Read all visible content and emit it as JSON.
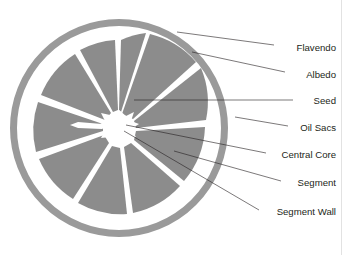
{
  "figure": {
    "background_color": "#ffffff",
    "border_color": "#e2e2e2",
    "width": 345,
    "height": 255
  },
  "colors": {
    "rind": "#9a9a9a",
    "segment_flesh": "#8c8c8c",
    "albedo": "#ffffff",
    "segment_wall": "#ffffff",
    "central_core": "#ffffff",
    "leader_line": "#231f20",
    "label_text": "#231f20"
  },
  "fruit": {
    "name": "citrus-cross-section",
    "center_x": 119,
    "center_y": 128,
    "outer_radius": 109,
    "rind_thickness": 7,
    "albedo_outer_radius": 102,
    "flesh_outer_radius": 88,
    "core_radius": 15,
    "segment_count": 10
  },
  "labels": [
    {
      "id": "flavendo",
      "text": "Flavendo",
      "text_x": 336,
      "text_y": 48,
      "leader_start_x": 274,
      "leader_start_y": 45,
      "leader_end_x": 177,
      "leader_end_y": 32,
      "points_to": "outer-rind"
    },
    {
      "id": "albedo",
      "text": "Albedo",
      "text_x": 336,
      "text_y": 75,
      "leader_start_x": 285,
      "leader_start_y": 72,
      "leader_end_x": 192,
      "leader_end_y": 52,
      "points_to": "white-pith-layer"
    },
    {
      "id": "seed",
      "text": "Seed",
      "text_x": 336,
      "text_y": 101,
      "leader_start_x": 293,
      "leader_start_y": 100,
      "leader_end_x": 134,
      "leader_end_y": 100,
      "points_to": "seed-cavity"
    },
    {
      "id": "oil-sacs",
      "text": "Oil Sacs",
      "text_x": 336,
      "text_y": 128,
      "leader_start_x": 288,
      "leader_start_y": 126,
      "leader_end_x": 235,
      "leader_end_y": 117,
      "points_to": "rind-oil-glands"
    },
    {
      "id": "central-core",
      "text": "Central Core",
      "text_x": 336,
      "text_y": 155,
      "leader_start_x": 266,
      "leader_start_y": 153,
      "leader_end_x": 126,
      "leader_end_y": 125,
      "points_to": "white-central-hub"
    },
    {
      "id": "segment",
      "text": "Segment",
      "text_x": 336,
      "text_y": 183,
      "leader_start_x": 281,
      "leader_start_y": 181,
      "leader_end_x": 174,
      "leader_end_y": 151,
      "points_to": "flesh-wedge"
    },
    {
      "id": "segment-wall",
      "text": "Segment Wall",
      "text_x": 336,
      "text_y": 212,
      "leader_start_x": 259,
      "leader_start_y": 210,
      "leader_end_x": 124,
      "leader_end_y": 131,
      "points_to": "white-dividing-membrane"
    }
  ]
}
